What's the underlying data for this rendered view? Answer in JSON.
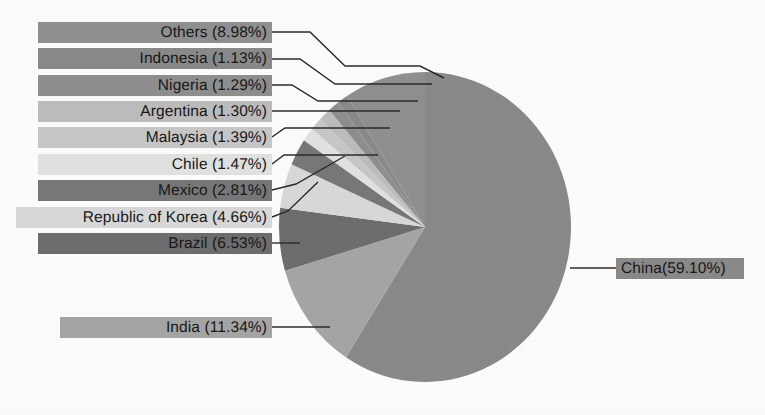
{
  "chart_data": {
    "type": "pie",
    "title": "",
    "subtitle": "",
    "xlabel": "",
    "ylabel": "",
    "grid": false,
    "legend_position": "callout-labels-left",
    "start_angle_deg": 0,
    "direction": "clockwise",
    "categories": [
      "China",
      "India",
      "Brazil",
      "Republic of Korea",
      "Mexico",
      "Chile",
      "Malaysia",
      "Argentina",
      "Nigeria",
      "Indonesia",
      "Others"
    ],
    "values": [
      59.1,
      11.34,
      6.53,
      4.66,
      2.81,
      1.47,
      1.39,
      1.3,
      1.29,
      1.13,
      8.98
    ],
    "value_unit": "%",
    "slices": [
      {
        "name": "China",
        "value": 59.1,
        "label": "China(59.10%)",
        "color": "#8a8a8a"
      },
      {
        "name": "India",
        "value": 11.34,
        "label": "India (11.34%)",
        "color": "#a6a6a6"
      },
      {
        "name": "Brazil",
        "value": 6.53,
        "label": "Brazil (6.53%)",
        "color": "#6e6e6e"
      },
      {
        "name": "Republic of Korea",
        "value": 4.66,
        "label": "Republic of Korea (4.66%)",
        "color": "#d9d9d9"
      },
      {
        "name": "Mexico",
        "value": 2.81,
        "label": "Mexico (2.81%)",
        "color": "#787878"
      },
      {
        "name": "Chile",
        "value": 1.47,
        "label": "Chile (1.47%)",
        "color": "#e2e2e2"
      },
      {
        "name": "Malaysia",
        "value": 1.39,
        "label": "Malaysia (1.39%)",
        "color": "#c8c8c8"
      },
      {
        "name": "Argentina",
        "value": 1.3,
        "label": "Argentina (1.30%)",
        "color": "#bdbdbd"
      },
      {
        "name": "Nigeria",
        "value": 1.29,
        "label": "Nigeria (1.29%)",
        "color": "#8f8f8f"
      },
      {
        "name": "Indonesia",
        "value": 1.13,
        "label": "Indonesia (1.13%)",
        "color": "#8a8a8a"
      },
      {
        "name": "Others",
        "value": 8.98,
        "label": "Others (8.98%)",
        "color": "#909090"
      }
    ]
  },
  "labels": {
    "others": "Others (8.98%)",
    "indonesia": "Indonesia (1.13%)",
    "nigeria": "Nigeria (1.29%)",
    "argentina": "Argentina (1.30%)",
    "malaysia": "Malaysia (1.39%)",
    "chile": "Chile (1.47%)",
    "mexico": "Mexico (2.81%)",
    "korea": "Republic of Korea (4.66%)",
    "brazil": "Brazil (6.53%)",
    "india": "India (11.34%)",
    "china": "China(59.10%)"
  },
  "colors": {
    "background": "#ffffff",
    "text": "#181818",
    "leader_line": "#2b2b2b",
    "china_slice": "#8a8a8a",
    "india_slice": "#a6a6a6",
    "brazil_slice": "#6e6e6e",
    "korea_slice": "#d9d9d9",
    "mexico_slice": "#787878",
    "chile_slice": "#e2e2e2",
    "malaysia_slice": "#c8c8c8",
    "argentina_slice": "#bdbdbd",
    "nigeria_slice": "#8f8f8f",
    "indonesia_slice": "#8a8a8a",
    "others_slice": "#909090"
  }
}
